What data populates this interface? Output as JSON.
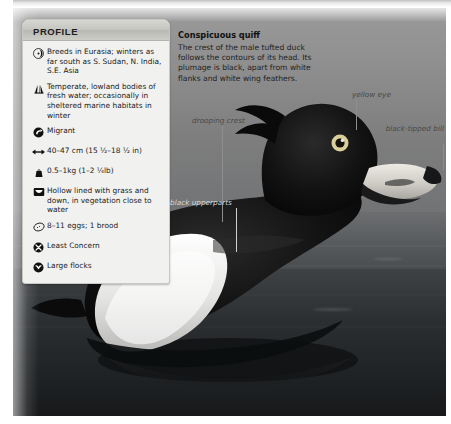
{
  "profile": {
    "header": "PROFILE",
    "items": [
      {
        "icon": "range-globe-icon",
        "text": "Breeds in Eurasia; winters as far south as S. Sudan, N. India, S.E. Asia"
      },
      {
        "icon": "habitat-grass-icon",
        "text": "Temperate, lowland bodies of fresh water; occasionally in sheltered marine habitats in winter"
      },
      {
        "icon": "migration-arrow-icon",
        "text": "Migrant"
      },
      {
        "icon": "length-arrows-icon",
        "text": "40–47 cm (15 ½–18 ½ in)"
      },
      {
        "icon": "weight-icon",
        "text": "0.5–1kg (1–2 ¼lb)"
      },
      {
        "icon": "nest-icon",
        "text": "Hollow lined with grass and down, in vegetation close to water"
      },
      {
        "icon": "egg-icon",
        "text": "8–11 eggs; 1 brood"
      },
      {
        "icon": "conservation-status-icon",
        "text": "Least Concern"
      },
      {
        "icon": "flock-icon",
        "text": "Large flocks"
      }
    ]
  },
  "caption": {
    "title": "Conspicuous quiff",
    "body": "The crest of the male tufted duck follows the contours of its head. Its plumage is black, apart from white flanks and white wing feathers."
  },
  "annotations": [
    {
      "name": "drooping-crest",
      "label": "drooping crest"
    },
    {
      "name": "yellow-eye",
      "label": "yellow eye"
    },
    {
      "name": "black-tipped-bill",
      "label": "black-tipped bill"
    },
    {
      "name": "black-upperparts",
      "label": "black upperparts"
    }
  ],
  "colors": {
    "card_bg": "#f1f1ef",
    "card_header": "#c6c6c1",
    "text": "#1b1b1b",
    "annotation": "#4a4a4a",
    "eye_yellow": "#d8cf9a"
  }
}
